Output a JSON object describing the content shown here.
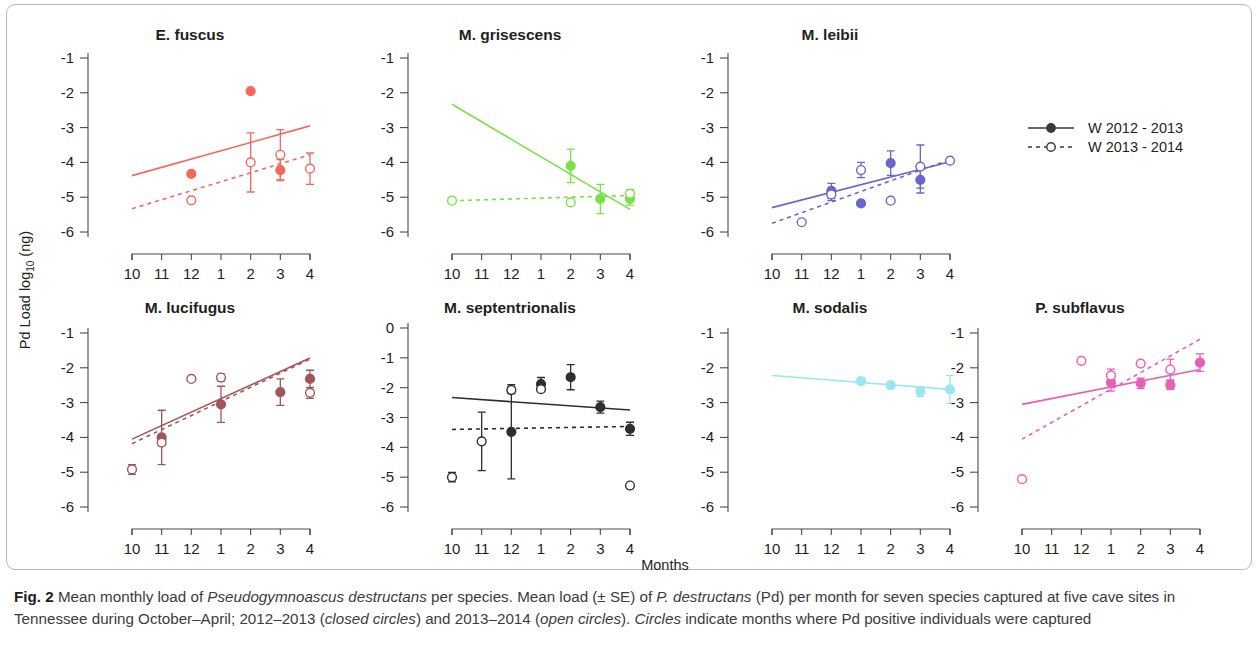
{
  "figure": {
    "label": "Fig. 2",
    "y_axis_title_part1": "Pd Load log",
    "y_axis_title_sub": "10",
    "y_axis_title_part2": " (ng)",
    "x_axis_title": "Months"
  },
  "legend": {
    "position": "right-top",
    "items": [
      {
        "label": "W 2012 - 2013",
        "style": "solid",
        "marker": "closed-circle",
        "color": "#3a3a3c"
      },
      {
        "label": "W 2013 - 2014",
        "style": "dashed",
        "marker": "open-circle",
        "color": "#3a3a3c"
      }
    ]
  },
  "caption": {
    "bold_prefix": "Fig. 2",
    "seg1": " Mean monthly load of ",
    "italic1": "Pseudogymnoascus destructans",
    "seg2": " per species. Mean load (± SE) of ",
    "italic2": "P. destructans",
    "seg3": " (Pd) per month for seven species captured at five cave sites in Tennessee during October–April; 2012–2013 (",
    "italic3": "closed circles",
    "seg4": ") and 2013–2014 (",
    "italic4": "open circles",
    "seg5": "). ",
    "italic5": "Circles",
    "seg6": " indicate months where Pd positive individuals were captured"
  },
  "chart_data": {
    "type": "scatter",
    "title": "Mean monthly load of Pseudogymnoascus destructans per species",
    "xlabel": "Months",
    "ylabel": "Pd Load log10 (ng)",
    "x_categories": [
      "10",
      "11",
      "12",
      "1",
      "2",
      "3",
      "4"
    ],
    "x_index": [
      1,
      2,
      3,
      4,
      5,
      6,
      7
    ],
    "grid": false,
    "legend_position": "right",
    "series_names": [
      "W 2012 - 2013",
      "W 2013 - 2014"
    ],
    "panels": [
      {
        "name": "E. fuscus",
        "color": "#f4685e",
        "ylim": [
          -6,
          -1
        ],
        "yticks": [
          -1,
          -2,
          -3,
          -4,
          -5,
          -6
        ],
        "fit_closed": {
          "x": [
            1,
            7
          ],
          "y": [
            -4.38,
            -2.95
          ]
        },
        "fit_open": {
          "x": [
            1,
            7
          ],
          "y": [
            -5.33,
            -3.78
          ]
        },
        "closed": [
          {
            "month": "12",
            "x": 3,
            "y": -4.33,
            "se": 0
          },
          {
            "month": "2",
            "x": 5,
            "y": -1.95,
            "se": 0
          },
          {
            "month": "3",
            "x": 6,
            "y": -4.22,
            "se": 0.3
          }
        ],
        "open": [
          {
            "month": "12",
            "x": 3,
            "y": -5.09,
            "se": 0
          },
          {
            "month": "2",
            "x": 5,
            "y": -4.0,
            "se": 0.85
          },
          {
            "month": "3",
            "x": 6,
            "y": -3.78,
            "se": 0.72
          },
          {
            "month": "4",
            "x": 7,
            "y": -4.18,
            "se": 0.45
          }
        ]
      },
      {
        "name": "M. grisescens",
        "color": "#7ae244",
        "ylim": [
          -6,
          -1
        ],
        "yticks": [
          -1,
          -2,
          -3,
          -4,
          -5,
          -6
        ],
        "fit_closed": {
          "x": [
            1,
            7
          ],
          "y": [
            -2.33,
            -5.35
          ]
        },
        "fit_open": {
          "x": [
            1,
            7
          ],
          "y": [
            -5.1,
            -4.95
          ]
        },
        "closed": [
          {
            "month": "2",
            "x": 5,
            "y": -4.1,
            "se": 0.48
          },
          {
            "month": "3",
            "x": 6,
            "y": -5.05,
            "se": 0.42
          },
          {
            "month": "4",
            "x": 7,
            "y": -5.05,
            "se": 0.18
          }
        ],
        "open": [
          {
            "month": "10",
            "x": 1,
            "y": -5.1,
            "se": 0
          },
          {
            "month": "2",
            "x": 5,
            "y": -5.15,
            "se": 0
          },
          {
            "month": "4",
            "x": 7,
            "y": -4.9,
            "se": 0.12
          }
        ]
      },
      {
        "name": "M. leibii",
        "color": "#6a66cc",
        "ylim": [
          -6,
          -1
        ],
        "yticks": [
          -1,
          -2,
          -3,
          -4,
          -5,
          -6
        ],
        "fit_closed": {
          "x": [
            1,
            7
          ],
          "y": [
            -5.3,
            -3.98
          ]
        },
        "fit_open": {
          "x": [
            1,
            7
          ],
          "y": [
            -5.75,
            -3.92
          ]
        },
        "closed": [
          {
            "month": "12",
            "x": 3,
            "y": -4.82,
            "se": 0.22
          },
          {
            "month": "1",
            "x": 4,
            "y": -5.18,
            "se": 0
          },
          {
            "month": "2",
            "x": 5,
            "y": -4.02,
            "se": 0.35
          },
          {
            "month": "3",
            "x": 6,
            "y": -4.5,
            "se": 0.38
          }
        ],
        "open": [
          {
            "month": "11",
            "x": 2,
            "y": -5.72,
            "se": 0
          },
          {
            "month": "12",
            "x": 3,
            "y": -4.92,
            "se": 0.18
          },
          {
            "month": "1",
            "x": 4,
            "y": -4.22,
            "se": 0.22
          },
          {
            "month": "2",
            "x": 5,
            "y": -5.1,
            "se": 0
          },
          {
            "month": "3",
            "x": 6,
            "y": -4.12,
            "se": 0.62
          },
          {
            "month": "4",
            "x": 7,
            "y": -3.95,
            "se": 0
          }
        ]
      },
      {
        "name": "M. lucifugus",
        "color": "#a0575a",
        "ylim": [
          -6,
          -1
        ],
        "yticks": [
          -1,
          -2,
          -3,
          -4,
          -5,
          -6
        ],
        "fit_closed": {
          "x": [
            1,
            7
          ],
          "y": [
            -4.05,
            -1.72
          ]
        },
        "fit_open": {
          "x": [
            1,
            7
          ],
          "y": [
            -4.18,
            -1.75
          ]
        },
        "closed": [
          {
            "month": "11",
            "x": 2,
            "y": -4.0,
            "se": 0.78
          },
          {
            "month": "1",
            "x": 4,
            "y": -3.05,
            "se": 0.52
          },
          {
            "month": "3",
            "x": 6,
            "y": -2.7,
            "se": 0.38
          },
          {
            "month": "4",
            "x": 7,
            "y": -2.32,
            "se": 0.25
          }
        ],
        "open": [
          {
            "month": "10",
            "x": 1,
            "y": -4.92,
            "se": 0.14
          },
          {
            "month": "11",
            "x": 2,
            "y": -4.15,
            "se": 0
          },
          {
            "month": "12",
            "x": 3,
            "y": -2.32,
            "se": 0
          },
          {
            "month": "1",
            "x": 4,
            "y": -2.28,
            "se": 0.1
          },
          {
            "month": "4",
            "x": 7,
            "y": -2.72,
            "se": 0.16
          }
        ]
      },
      {
        "name": "M. septentrionalis",
        "color": "#2f2f31",
        "ylim": [
          -6,
          0
        ],
        "yticks": [
          0,
          -1,
          -2,
          -3,
          -4,
          -5,
          -6
        ],
        "fit_closed": {
          "x": [
            1,
            7
          ],
          "y": [
            -2.33,
            -2.75
          ]
        },
        "fit_open": {
          "x": [
            1,
            7
          ],
          "y": [
            -3.4,
            -3.3
          ]
        },
        "closed": [
          {
            "month": "12",
            "x": 3,
            "y": -3.48,
            "se": 1.58
          },
          {
            "month": "1",
            "x": 4,
            "y": -1.88,
            "se": 0.22
          },
          {
            "month": "2",
            "x": 5,
            "y": -1.65,
            "se": 0.42
          },
          {
            "month": "3",
            "x": 6,
            "y": -2.65,
            "se": 0.2
          },
          {
            "month": "4",
            "x": 7,
            "y": -3.38,
            "se": 0.22
          }
        ],
        "open": [
          {
            "month": "10",
            "x": 1,
            "y": -5.0,
            "se": 0.16
          },
          {
            "month": "11",
            "x": 2,
            "y": -3.8,
            "se": 0.98
          },
          {
            "month": "12",
            "x": 3,
            "y": -2.08,
            "se": 0.12
          },
          {
            "month": "1",
            "x": 4,
            "y": -2.05,
            "se": 0
          },
          {
            "month": "4",
            "x": 7,
            "y": -5.28,
            "se": 0
          }
        ]
      },
      {
        "name": "M. sodalis",
        "color": "#9ae8ee",
        "ylim": [
          -6,
          -1
        ],
        "yticks": [
          -1,
          -2,
          -3,
          -4,
          -5,
          -6
        ],
        "fit_closed": {
          "x": [
            1,
            7
          ],
          "y": [
            -2.22,
            -2.62
          ]
        },
        "fit_open": null,
        "closed": [
          {
            "month": "1",
            "x": 4,
            "y": -2.38,
            "se": 0.1
          },
          {
            "month": "2",
            "x": 5,
            "y": -2.5,
            "se": 0.1
          },
          {
            "month": "3",
            "x": 6,
            "y": -2.68,
            "se": 0.14
          },
          {
            "month": "4",
            "x": 7,
            "y": -2.62,
            "se": 0.4
          }
        ],
        "open": []
      },
      {
        "name": "P. subflavus",
        "color": "#e85fb4",
        "ylim": [
          -6,
          -1
        ],
        "yticks": [
          -1,
          -2,
          -3,
          -4,
          -5,
          -6
        ],
        "fit_closed": {
          "x": [
            1,
            7
          ],
          "y": [
            -3.05,
            -2.05
          ]
        },
        "fit_open": {
          "x": [
            1,
            7
          ],
          "y": [
            -4.05,
            -1.18
          ]
        },
        "closed": [
          {
            "month": "1",
            "x": 4,
            "y": -2.42,
            "se": 0.25
          },
          {
            "month": "2",
            "x": 5,
            "y": -2.45,
            "se": 0.15
          },
          {
            "month": "3",
            "x": 6,
            "y": -2.5,
            "se": 0.12
          },
          {
            "month": "4",
            "x": 7,
            "y": -1.85,
            "se": 0.25
          }
        ],
        "open": [
          {
            "month": "10",
            "x": 1,
            "y": -5.2,
            "se": 0
          },
          {
            "month": "12",
            "x": 3,
            "y": -1.8,
            "se": 0
          },
          {
            "month": "1",
            "x": 4,
            "y": -2.22,
            "se": 0.18
          },
          {
            "month": "2",
            "x": 5,
            "y": -1.88,
            "se": 0
          },
          {
            "month": "3",
            "x": 6,
            "y": -2.05,
            "se": 0.3
          }
        ]
      }
    ]
  }
}
